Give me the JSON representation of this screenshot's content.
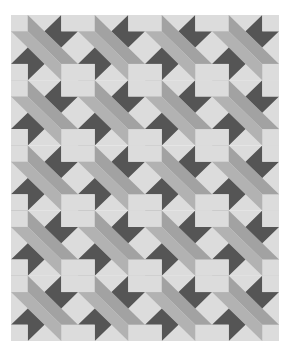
{
  "image": {
    "description": "Grayscale quilt pattern of repeating star / pinwheel blocks",
    "layout": {
      "columns": 4,
      "rows": 5,
      "cell_width": 67,
      "cell_height": 65.2
    },
    "colors": {
      "background": "#ffffff",
      "light": "#dcdcdc",
      "band_upper": "#a2a2a2",
      "band_lower": "#b2b2b2",
      "dark": "#555555",
      "square_edge": "#cfcfcf"
    }
  }
}
